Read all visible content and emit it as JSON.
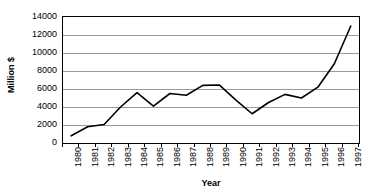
{
  "chart_data": {
    "type": "line",
    "title": "",
    "xlabel": "Year",
    "ylabel": "Million $",
    "categories": [
      "1980",
      "1981",
      "1982",
      "1983",
      "1984",
      "1985",
      "1986",
      "1987",
      "1988",
      "1989",
      "1990",
      "1991",
      "1992",
      "1993",
      "1994",
      "1995",
      "1996",
      "1997"
    ],
    "values": [
      800,
      1800,
      2050,
      4000,
      5600,
      4100,
      5500,
      5300,
      6400,
      6450,
      4800,
      3250,
      4500,
      5400,
      5000,
      6200,
      8800,
      13000
    ],
    "series": [
      {
        "name": "Million $",
        "values": [
          800,
          1800,
          2050,
          4000,
          5600,
          4100,
          5500,
          5300,
          6400,
          6450,
          4800,
          3250,
          4500,
          5400,
          5000,
          6200,
          8800,
          13000
        ]
      }
    ],
    "ylim": [
      0,
      14000
    ],
    "yticks": [
      0,
      2000,
      4000,
      6000,
      8000,
      10000,
      12000,
      14000
    ],
    "ytick_labels": [
      "0",
      "2000",
      "4000",
      "6000",
      "8000",
      "10000",
      "12000",
      "14000"
    ],
    "grid": true,
    "grid_axis": "y",
    "legend": false,
    "legend_position": "none",
    "line_color": "#000000",
    "grid_color": "#9a9a9a",
    "axis_color": "#000000",
    "background_color": "#ffffff"
  }
}
